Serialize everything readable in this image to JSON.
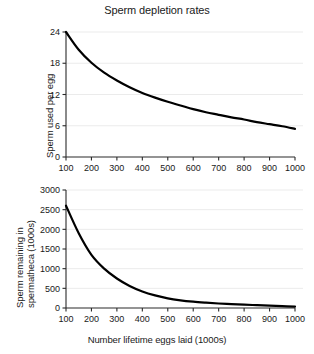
{
  "figure": {
    "title": "Sperm depletion rates",
    "background_color": "#ffffff",
    "line_color": "#000000",
    "grid_color": "#ebebeb",
    "axis_color": "#2a2a2a"
  },
  "panels": {
    "top": {
      "name": "sperm-used-per-egg-panel",
      "ylabel": "Sperm used per egg",
      "xlabel": "",
      "yticks": [
        "0",
        "6",
        "12",
        "18",
        "24"
      ],
      "xticks": [
        "100",
        "200",
        "300",
        "400",
        "500",
        "600",
        "700",
        "800",
        "900",
        "1000"
      ]
    },
    "bottom": {
      "name": "sperm-remaining-panel",
      "ylabel_line1": "Sperm remaining in",
      "ylabel_line2": "spermatheca (1000s)",
      "xlabel": "Number lifetime eggs laid (1000s)",
      "yticks": [
        "0",
        "500",
        "1000",
        "1500",
        "2000",
        "2500",
        "3000"
      ],
      "xticks": [
        "100",
        "200",
        "300",
        "400",
        "500",
        "600",
        "700",
        "800",
        "900",
        "1000"
      ]
    }
  },
  "chart_data": [
    {
      "type": "line",
      "title": "Sperm depletion rates",
      "panel": "top",
      "xlabel": "Number lifetime eggs laid (1000s)",
      "ylabel": "Sperm used per egg",
      "xlim": [
        100,
        1000
      ],
      "ylim": [
        0,
        24
      ],
      "xticks": [
        100,
        200,
        300,
        400,
        500,
        600,
        700,
        800,
        900,
        1000
      ],
      "yticks": [
        0,
        6,
        12,
        18,
        24
      ],
      "grid": "horizontal",
      "legend": "none",
      "series": [
        {
          "name": "Sperm used per egg",
          "x": [
            100,
            150,
            200,
            250,
            300,
            350,
            400,
            450,
            500,
            550,
            600,
            650,
            700,
            750,
            800,
            850,
            900,
            950,
            1000
          ],
          "values": [
            24.0,
            20.6,
            18.1,
            16.2,
            14.7,
            13.4,
            12.3,
            11.4,
            10.6,
            9.9,
            9.2,
            8.6,
            8.1,
            7.6,
            7.2,
            6.7,
            6.3,
            5.9,
            5.4
          ]
        }
      ]
    },
    {
      "type": "line",
      "title": "",
      "panel": "bottom",
      "xlabel": "Number lifetime eggs laid (1000s)",
      "ylabel": "Sperm remaining in spermatheca (1000s)",
      "xlim": [
        100,
        1000
      ],
      "ylim": [
        0,
        3000
      ],
      "xticks": [
        100,
        200,
        300,
        400,
        500,
        600,
        700,
        800,
        900,
        1000
      ],
      "yticks": [
        0,
        500,
        1000,
        1500,
        2000,
        2500,
        3000
      ],
      "grid": "horizontal",
      "legend": "none",
      "series": [
        {
          "name": "Sperm remaining in spermatheca (1000s)",
          "x": [
            100,
            150,
            200,
            250,
            300,
            350,
            400,
            450,
            500,
            550,
            600,
            650,
            700,
            750,
            800,
            850,
            900,
            950,
            1000
          ],
          "values": [
            2600,
            1900,
            1350,
            1000,
            750,
            560,
            420,
            320,
            245,
            195,
            160,
            135,
            115,
            100,
            85,
            72,
            60,
            48,
            35
          ]
        }
      ]
    }
  ]
}
